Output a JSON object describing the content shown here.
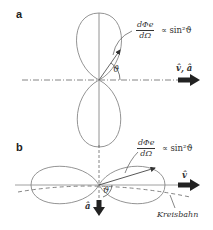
{
  "panels": {
    "a": {
      "label": "a",
      "formula_num": "dΦe",
      "formula_den": "dΩ",
      "formula_rhs": "∝ sin²ϑ",
      "angle": "ϑ",
      "axis_label": "v̂, â"
    },
    "b": {
      "label": "b",
      "formula_num": "dΦe",
      "formula_den": "dΩ",
      "formula_rhs": "∝ sin²ϑ",
      "angle": "ϑ",
      "axis_label_v": "v̂",
      "axis_label_a": "â",
      "orbit_label": "Kreisbahn"
    }
  },
  "colors": {
    "line": "#777777",
    "arrow": "#222222",
    "text": "#333333"
  }
}
